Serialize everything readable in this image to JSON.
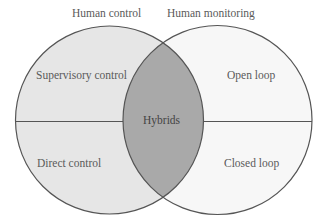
{
  "diagram": {
    "type": "venn",
    "circles": [
      {
        "title": "Human control",
        "fill": "#e6e6e6"
      },
      {
        "title": "Human monitoring",
        "fill": "#f7f7f7"
      }
    ],
    "intersection": {
      "label": "Hybrids",
      "fill": "#a9a9a9"
    },
    "stroke": "#555555",
    "regions": {
      "left_top": "Supervisory control",
      "left_bottom": "Direct control",
      "right_top": "Open loop",
      "right_bottom": "Closed loop"
    }
  }
}
